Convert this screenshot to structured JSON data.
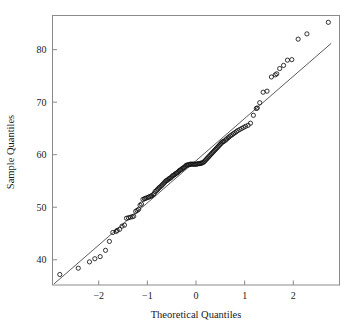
{
  "chart_data": {
    "type": "scatter",
    "title": "",
    "xlabel": "Theoretical Quantiles",
    "ylabel": "Sample Quantiles",
    "xlim": [
      -2.95,
      2.95
    ],
    "ylim": [
      35.2,
      86.5
    ],
    "xticks": [
      -2,
      -1,
      0,
      1,
      2
    ],
    "xticklabels": [
      "−2",
      "−1",
      "0",
      "1",
      "2"
    ],
    "yticks": [
      40,
      50,
      60,
      70,
      80
    ],
    "yticklabels": [
      "40",
      "50",
      "60",
      "70",
      "80"
    ],
    "grid": false,
    "legend": false,
    "marker": "open-circle",
    "marker_size": 2.1,
    "reference_line": {
      "label": "qq-line",
      "x": [
        -2.92,
        2.78
      ],
      "y": [
        35.4,
        81.2
      ]
    },
    "series": [
      {
        "name": "Sample vs Theoretical Quantiles",
        "x": [
          -2.8,
          -2.42,
          -2.19,
          -2.08,
          -1.97,
          -1.86,
          -1.78,
          -1.71,
          -1.64,
          -1.62,
          -1.57,
          -1.52,
          -1.47,
          -1.43,
          -1.39,
          -1.35,
          -1.31,
          -1.28,
          -1.24,
          -1.21,
          -1.18,
          -1.15,
          -1.12,
          -1.09,
          -1.06,
          -1.04,
          -1.01,
          -0.98,
          -0.96,
          -0.93,
          -0.91,
          -0.88,
          -0.86,
          -0.84,
          -0.81,
          -0.79,
          -0.77,
          -0.75,
          -0.72,
          -0.7,
          -0.68,
          -0.66,
          -0.64,
          -0.62,
          -0.6,
          -0.58,
          -0.56,
          -0.54,
          -0.52,
          -0.5,
          -0.48,
          -0.46,
          -0.44,
          -0.42,
          -0.4,
          -0.38,
          -0.36,
          -0.34,
          -0.32,
          -0.3,
          -0.28,
          -0.26,
          -0.24,
          -0.22,
          -0.2,
          -0.18,
          -0.16,
          -0.14,
          -0.12,
          -0.1,
          -0.08,
          -0.06,
          -0.04,
          -0.02,
          0.0,
          0.02,
          0.04,
          0.06,
          0.08,
          0.1,
          0.12,
          0.14,
          0.16,
          0.18,
          0.2,
          0.22,
          0.24,
          0.26,
          0.28,
          0.3,
          0.32,
          0.34,
          0.36,
          0.38,
          0.4,
          0.42,
          0.44,
          0.46,
          0.48,
          0.5,
          0.52,
          0.54,
          0.56,
          0.58,
          0.61,
          0.63,
          0.66,
          0.68,
          0.71,
          0.74,
          0.77,
          0.8,
          0.83,
          0.86,
          0.9,
          0.94,
          0.98,
          1.02,
          1.07,
          1.12,
          1.18,
          1.24,
          1.26,
          1.31,
          1.38,
          1.46,
          1.55,
          1.63,
          1.66,
          1.72,
          1.8,
          1.88,
          1.97,
          2.1,
          2.28,
          2.72
        ],
        "y": [
          37.2,
          38.4,
          39.6,
          40.2,
          40.6,
          41.8,
          43.5,
          45.2,
          45.4,
          45.6,
          45.8,
          46.4,
          46.6,
          47.9,
          48.0,
          48.1,
          48.2,
          48.3,
          49.2,
          49.4,
          49.6,
          50.4,
          50.6,
          51.5,
          51.6,
          51.7,
          51.8,
          51.9,
          52.0,
          52.1,
          52.2,
          52.4,
          52.6,
          53.0,
          53.2,
          53.4,
          53.6,
          53.8,
          54.0,
          54.2,
          54.4,
          54.6,
          54.8,
          55.0,
          55.1,
          55.2,
          55.4,
          55.5,
          55.6,
          55.8,
          56.0,
          56.1,
          56.2,
          56.4,
          56.5,
          56.6,
          56.8,
          57.0,
          57.1,
          57.2,
          57.4,
          57.5,
          57.6,
          57.8,
          58.0,
          58.0,
          58.1,
          58.1,
          58.2,
          58.2,
          58.2,
          58.2,
          58.2,
          58.2,
          58.2,
          58.2,
          58.3,
          58.3,
          58.3,
          58.4,
          58.4,
          58.5,
          58.6,
          58.8,
          59.0,
          59.2,
          59.4,
          59.6,
          59.8,
          60.0,
          60.2,
          60.4,
          60.6,
          60.8,
          61.0,
          61.2,
          61.4,
          61.6,
          61.8,
          62.0,
          62.2,
          62.4,
          62.5,
          62.6,
          62.8,
          63.0,
          63.2,
          63.4,
          63.6,
          63.8,
          64.0,
          64.2,
          64.4,
          64.6,
          64.8,
          65.0,
          65.2,
          65.4,
          65.6,
          66.0,
          67.5,
          68.8,
          68.9,
          69.9,
          71.9,
          72.1,
          74.8,
          75.2,
          75.4,
          76.4,
          77.0,
          78.0,
          78.1,
          82.0,
          83.0,
          85.2
        ]
      }
    ]
  }
}
